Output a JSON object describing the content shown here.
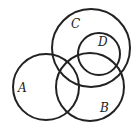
{
  "diagram": {
    "type": "venn",
    "stroke_color": "#222222",
    "stroke_width": 2,
    "sets": [
      {
        "id": "C",
        "label": "C",
        "cx": 91,
        "cy": 48,
        "r": 39,
        "label_x": 71,
        "label_y": 28
      },
      {
        "id": "D",
        "label": "D",
        "cx": 99,
        "cy": 54,
        "r": 21,
        "label_x": 98,
        "label_y": 46
      },
      {
        "id": "A",
        "label": "A",
        "cx": 46,
        "cy": 87,
        "r": 33,
        "label_x": 18,
        "label_y": 92
      },
      {
        "id": "B",
        "label": "B",
        "cx": 90,
        "cy": 87,
        "r": 34,
        "label_x": 100,
        "label_y": 112
      }
    ]
  }
}
